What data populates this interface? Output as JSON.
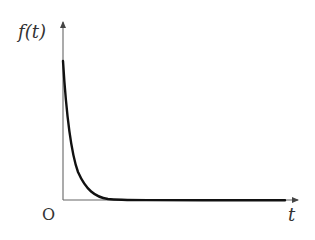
{
  "diagram": {
    "y_axis_label": "f(t)",
    "x_axis_label": "t",
    "origin_label": "O",
    "colors": {
      "axis": "#555555",
      "curve": "#111111",
      "text": "#333333"
    }
  }
}
